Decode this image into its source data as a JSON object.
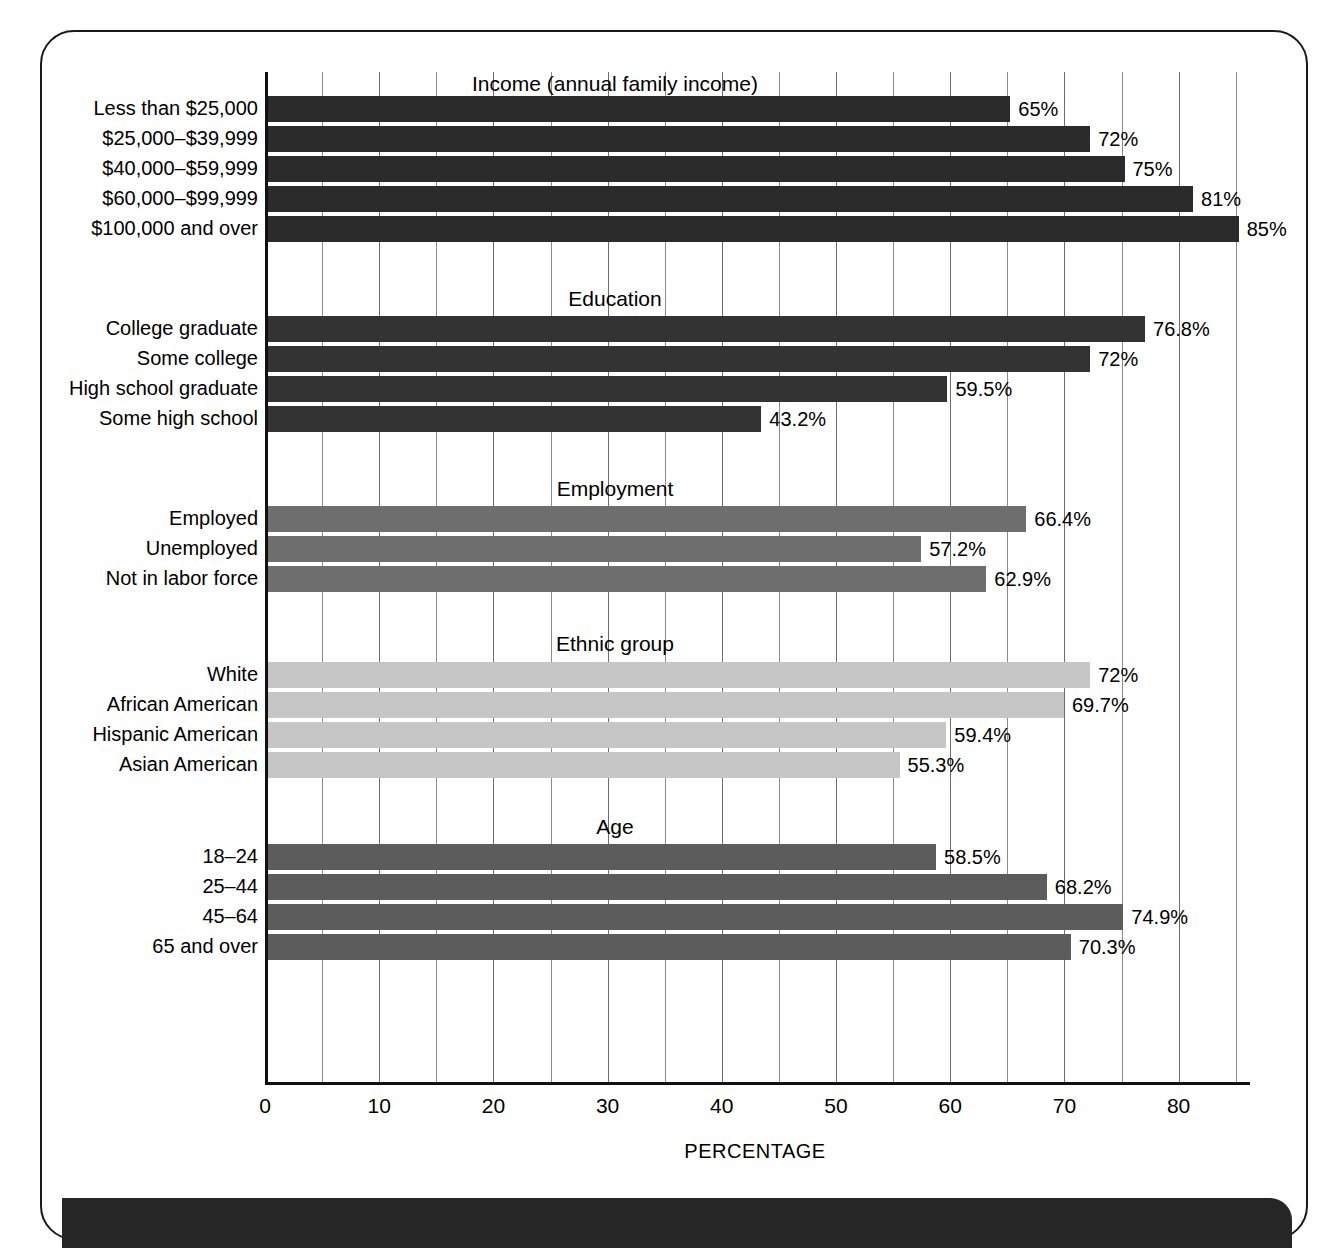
{
  "chart_data": {
    "type": "bar",
    "orientation": "horizontal",
    "title": "",
    "xlabel": "PERCENTAGE",
    "ylabel": "",
    "xlim": [
      0,
      88
    ],
    "xticks": [
      0,
      10,
      20,
      30,
      40,
      50,
      60,
      70,
      80
    ],
    "xtick_labels": [
      "0",
      "10",
      "20",
      "30",
      "40",
      "50",
      "60",
      "70",
      "80"
    ],
    "minor_gridline_step": 5,
    "grid": true,
    "legend": "none",
    "value_suffix": "%",
    "groups": [
      {
        "name": "income",
        "title": "Income (annual family income)",
        "color": "#2b2b2b",
        "categories": [
          "Less than $25,000",
          "$25,000–$39,999",
          "$40,000–$59,999",
          "$60,000–$99,999",
          "$100,000 and over"
        ],
        "values": [
          65,
          72,
          75,
          81,
          85
        ],
        "labels": [
          "65%",
          "72%",
          "75%",
          "81%",
          "85%"
        ]
      },
      {
        "name": "education",
        "title": "Education",
        "color": "#333333",
        "categories": [
          "College graduate",
          "Some college",
          "High school graduate",
          "Some high school"
        ],
        "values": [
          76.8,
          72,
          59.5,
          43.2
        ],
        "labels": [
          "76.8%",
          "72%",
          "59.5%",
          "43.2%"
        ]
      },
      {
        "name": "employment",
        "title": "Employment",
        "color": "#6e6e6e",
        "categories": [
          "Employed",
          "Unemployed",
          "Not in labor force"
        ],
        "values": [
          66.4,
          57.2,
          62.9
        ],
        "labels": [
          "66.4%",
          "57.2%",
          "62.9%"
        ]
      },
      {
        "name": "ethnic-group",
        "title": "Ethnic group",
        "color": "#c6c6c6",
        "categories": [
          "White",
          "African American",
          "Hispanic American",
          "Asian American"
        ],
        "values": [
          72,
          69.7,
          59.4,
          55.3
        ],
        "labels": [
          "72%",
          "69.7%",
          "59.4%",
          "55.3%"
        ]
      },
      {
        "name": "age",
        "title": "Age",
        "color": "#5c5c5c",
        "categories": [
          "18–24",
          "25–44",
          "45–64",
          "65 and over"
        ],
        "values": [
          58.5,
          68.2,
          74.9,
          70.3
        ],
        "labels": [
          "58.5%",
          "68.2%",
          "74.9%",
          "70.3%"
        ]
      }
    ]
  }
}
